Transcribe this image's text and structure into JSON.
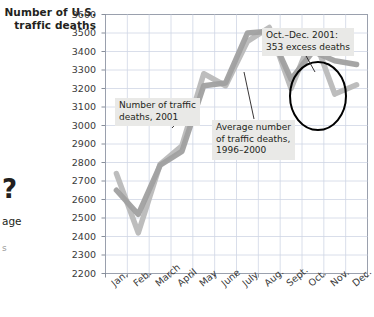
{
  "figure": {
    "axis_title": "Number of U.S. traffic deaths",
    "margin_glyph": "?",
    "margin_fragment": "age",
    "margin_fragment_small": "s"
  },
  "annotations": {
    "series_2001": "Number of traffic\ndeaths, 2001",
    "series_avg": "Average number\nof traffic deaths,\n1996–2000",
    "excess": "Oct.–Dec. 2001:\n353 excess deaths"
  },
  "colors": {
    "line_2001": "#b9b9b9",
    "line_avg": "#a0a0a0",
    "grid": "#cfd6e4",
    "frame": "#9aa0ad",
    "callout_bg": "#e9e9e7",
    "highlight_circle": "#000000",
    "text": "#231f20"
  },
  "chart_data": {
    "type": "line",
    "title": "Number of U.S. traffic deaths",
    "xlabel": "",
    "ylabel": "Number of U.S. traffic deaths",
    "ylim": [
      2200,
      3600
    ],
    "grid": true,
    "legend_position": "inline-annotations",
    "categories": [
      "Jan.",
      "Feb.",
      "March",
      "April",
      "May",
      "June",
      "July",
      "Aug.",
      "Sept.",
      "Oct.",
      "Nov.",
      "Dec."
    ],
    "yticks": [
      2200,
      2300,
      2400,
      2500,
      2600,
      2700,
      2800,
      2900,
      3000,
      3100,
      3200,
      3300,
      3400,
      3500,
      3600
    ],
    "series": [
      {
        "name": "Number of traffic deaths, 2001",
        "values": [
          2740,
          2420,
          2790,
          2890,
          3280,
          3215,
          3455,
          3530,
          3200,
          3490,
          3170,
          3220
        ]
      },
      {
        "name": "Average number of traffic deaths, 1996–2000",
        "values": [
          2650,
          2520,
          2785,
          2860,
          3215,
          3230,
          3500,
          3510,
          3250,
          3400,
          3350,
          3330
        ]
      }
    ],
    "annotation_note": "Oct.–Dec. 2001: 353 excess deaths"
  }
}
